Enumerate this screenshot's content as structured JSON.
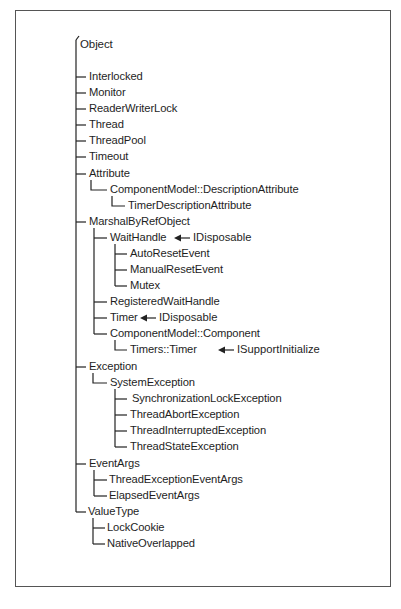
{
  "diagram": {
    "type": "class-hierarchy-tree",
    "root": "Object",
    "nodes": [
      {
        "label": "Object",
        "level": 0
      },
      {
        "label": "Interlocked",
        "level": 1
      },
      {
        "label": "Monitor",
        "level": 1
      },
      {
        "label": "ReaderWriterLock",
        "level": 1
      },
      {
        "label": "Thread",
        "level": 1
      },
      {
        "label": "ThreadPool",
        "level": 1
      },
      {
        "label": "Timeout",
        "level": 1
      },
      {
        "label": "Attribute",
        "level": 1
      },
      {
        "label": "ComponentModel::DescriptionAttribute",
        "level": 2
      },
      {
        "label": "TimerDescriptionAttribute",
        "level": 3
      },
      {
        "label": "MarshalByRefObject",
        "level": 1
      },
      {
        "label": "WaitHandle",
        "level": 2,
        "implements": "IDisposable"
      },
      {
        "label": "AutoResetEvent",
        "level": 3
      },
      {
        "label": "ManualResetEvent",
        "level": 3
      },
      {
        "label": "Mutex",
        "level": 3
      },
      {
        "label": "RegisteredWaitHandle",
        "level": 2
      },
      {
        "label": "Timer",
        "level": 2,
        "implements": "IDisposable"
      },
      {
        "label": "ComponentModel::Component",
        "level": 2
      },
      {
        "label": "Timers::Timer",
        "level": 3,
        "implements": "ISupportInitialize"
      },
      {
        "label": "Exception",
        "level": 1
      },
      {
        "label": "SystemException",
        "level": 2
      },
      {
        "label": "SynchronizationLockException",
        "level": 3
      },
      {
        "label": "ThreadAbortException",
        "level": 3
      },
      {
        "label": "ThreadInterruptedException",
        "level": 3
      },
      {
        "label": "ThreadStateException",
        "level": 3
      },
      {
        "label": "EventArgs",
        "level": 1
      },
      {
        "label": "ThreadExceptionEventArgs",
        "level": 2
      },
      {
        "label": "ElapsedEventArgs",
        "level": 2
      },
      {
        "label": "ValueType",
        "level": 1
      },
      {
        "label": "LockCookie",
        "level": 2
      },
      {
        "label": "NativeOverlapped",
        "level": 2
      }
    ],
    "interfaces": {
      "waithandle": "IDisposable",
      "timer": "IDisposable",
      "timers_timer": "ISupportInitialize"
    }
  },
  "labels": {
    "object": "Object",
    "interlocked": "Interlocked",
    "monitor": "Monitor",
    "readerwriterlock": "ReaderWriterLock",
    "thread": "Thread",
    "threadpool": "ThreadPool",
    "timeout": "Timeout",
    "attribute": "Attribute",
    "descriptionattribute": "ComponentModel::DescriptionAttribute",
    "timerdescriptionattribute": "TimerDescriptionAttribute",
    "marshalbyrefobject": "MarshalByRefObject",
    "waithandle": "WaitHandle",
    "autoresetevent": "AutoResetEvent",
    "manualresetevent": "ManualResetEvent",
    "mutex": "Mutex",
    "registeredwaithandle": "RegisteredWaitHandle",
    "timer": "Timer",
    "component": "ComponentModel::Component",
    "timers_timer": "Timers::Timer",
    "exception": "Exception",
    "systemexception": "SystemException",
    "synchronizationlockexception": "SynchronizationLockException",
    "threadabortexception": "ThreadAbortException",
    "threadinterruptedexception": "ThreadInterruptedException",
    "threadstateexception": "ThreadStateException",
    "eventargs": "EventArgs",
    "threadexceptioneventargs": "ThreadExceptionEventArgs",
    "elapsedeventargs": "ElapsedEventArgs",
    "valuetype": "ValueType",
    "lockcookie": "LockCookie",
    "nativeoverlapped": "NativeOverlapped"
  }
}
